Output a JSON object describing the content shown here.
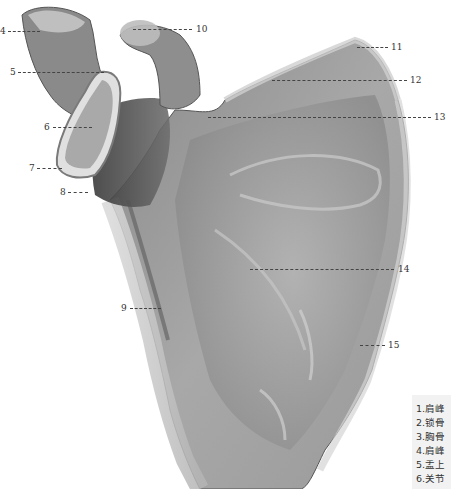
{
  "figure": {
    "callouts": [
      {
        "num": "4",
        "x": 0,
        "y": 31,
        "side": "left",
        "line_from": 8,
        "line_to": 40
      },
      {
        "num": "10",
        "x": 197,
        "y": 29,
        "side": "right",
        "line_from": 133,
        "line_to": 192
      },
      {
        "num": "5",
        "x": 10,
        "y": 72,
        "side": "left",
        "line_from": 18,
        "line_to": 104
      },
      {
        "num": "11",
        "x": 392,
        "y": 47,
        "side": "right",
        "line_from": 357,
        "line_to": 388
      },
      {
        "num": "12",
        "x": 411,
        "y": 80,
        "side": "right",
        "line_from": 272,
        "line_to": 407
      },
      {
        "num": "6",
        "x": 44,
        "y": 127,
        "side": "left",
        "line_from": 53,
        "line_to": 92
      },
      {
        "num": "13",
        "x": 435,
        "y": 117,
        "side": "right",
        "line_from": 208,
        "line_to": 431
      },
      {
        "num": "7",
        "x": 29,
        "y": 168,
        "side": "left",
        "line_from": 37,
        "line_to": 62
      },
      {
        "num": "8",
        "x": 60,
        "y": 192,
        "side": "left",
        "line_from": 68,
        "line_to": 88
      },
      {
        "num": "14",
        "x": 399,
        "y": 269,
        "side": "right",
        "line_from": 250,
        "line_to": 394
      },
      {
        "num": "9",
        "x": 121,
        "y": 308,
        "side": "left",
        "line_from": 130,
        "line_to": 161
      },
      {
        "num": "15",
        "x": 389,
        "y": 345,
        "side": "right",
        "line_from": 360,
        "line_to": 385
      }
    ]
  },
  "legend": {
    "items": [
      "1.肩峰",
      "2.锁骨",
      "3.胸骨",
      "4.肩峰",
      "5.盂上",
      "6.关节"
    ]
  },
  "colors": {
    "background": "#ffffff",
    "bone_light": "#c9c9c9",
    "bone_mid": "#9a9a9a",
    "bone_dark": "#4a4a4a",
    "legend_bg": "#f2f2f2",
    "label_text": "#333333"
  }
}
